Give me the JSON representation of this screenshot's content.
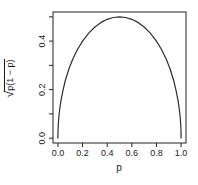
{
  "figure": {
    "background": "#ffffff"
  },
  "chart_data": {
    "type": "line",
    "title": "",
    "xlabel": "p",
    "ylabel": "sqrt(p(1-p))",
    "ylabel_radical_sign": "√",
    "ylabel_radicand": "p(1 − p)",
    "xlim": [
      -0.04,
      1.04
    ],
    "ylim": [
      -0.02,
      0.52
    ],
    "x_tick_values": [
      0.0,
      0.2,
      0.4,
      0.6,
      0.8,
      1.0
    ],
    "x_tick_labels": [
      "0.0",
      "0.2",
      "0.4",
      "0.6",
      "0.8",
      "1.0"
    ],
    "y_tick_values": [
      0.0,
      0.1,
      0.2,
      0.3,
      0.4,
      0.5
    ],
    "y_tick_labels": [
      "0.0",
      "",
      "0.2",
      "",
      "0.4",
      ""
    ],
    "grid": "off",
    "legend": "none",
    "axis_color": "#222222",
    "line_color": "#2e2e2e",
    "text_color": "#1a1a1a",
    "x": [
      0,
      0.001,
      0.004,
      0.009,
      0.016,
      0.025,
      0.04,
      0.06,
      0.09,
      0.12,
      0.16,
      0.2,
      0.25,
      0.3,
      0.35,
      0.4,
      0.45,
      0.5,
      0.55,
      0.6,
      0.65,
      0.7,
      0.75,
      0.8,
      0.84,
      0.88,
      0.91,
      0.94,
      0.96,
      0.975,
      0.984,
      0.991,
      0.996,
      0.999,
      1.0
    ],
    "y": [
      0,
      0.0316,
      0.0631,
      0.0944,
      0.1255,
      0.1561,
      0.196,
      0.2375,
      0.2862,
      0.325,
      0.3666,
      0.4,
      0.433,
      0.4583,
      0.477,
      0.4899,
      0.4975,
      0.5,
      0.4975,
      0.4899,
      0.477,
      0.4583,
      0.433,
      0.4,
      0.3666,
      0.325,
      0.2862,
      0.2375,
      0.196,
      0.1561,
      0.1255,
      0.0944,
      0.0631,
      0.0316,
      0
    ]
  }
}
